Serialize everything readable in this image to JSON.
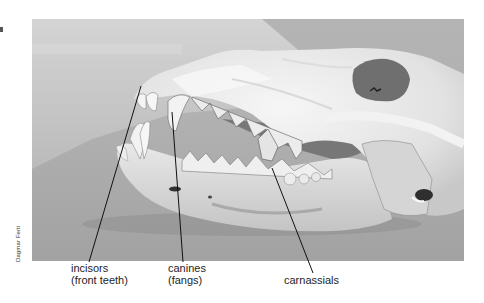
{
  "figure": {
    "photo_credit": "Dagmar Ferti",
    "labels": [
      {
        "id": "incisors",
        "line1": "incisors",
        "line2": "(front teeth)"
      },
      {
        "id": "canines",
        "line1": "canines",
        "line2": "(fangs)"
      },
      {
        "id": "carnassials",
        "line1": "carnassials",
        "line2": ""
      }
    ],
    "colors": {
      "background": "#ffffff",
      "photo_bg_top": "#c9c9c9",
      "photo_bg_floor": "#aaaaaa",
      "bone": "#ececec",
      "leader_line": "#111111",
      "label_text": "#1e1e1e"
    }
  }
}
